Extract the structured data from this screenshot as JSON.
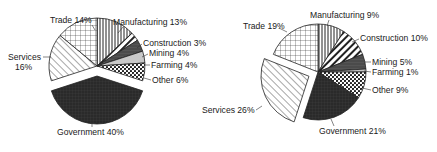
{
  "chart_data": [
    {
      "type": "pie",
      "title": "",
      "categories": [
        "Manufacturing",
        "Construction",
        "Mining",
        "Farming",
        "Other",
        "Government",
        "Services",
        "Trade"
      ],
      "values": [
        13,
        3,
        4,
        4,
        6,
        40,
        16,
        14
      ],
      "labels": [
        "Manufacturing 13%",
        "Construction 3%",
        "Mining 4%",
        "Farming 4%",
        "Other 6%",
        "Government 40%",
        "Services 16%",
        "Trade 14%"
      ],
      "exploded": "Government",
      "fills": [
        "vertical-lines",
        "diagonal-stripes",
        "dark-gray",
        "light-gray",
        "dots",
        "black-grid",
        "diagonal-lines",
        "grid"
      ]
    },
    {
      "type": "pie",
      "title": "",
      "categories": [
        "Manufacturing",
        "Construction",
        "Mining",
        "Farming",
        "Other",
        "Government",
        "Services",
        "Trade"
      ],
      "values": [
        9,
        10,
        5,
        1,
        9,
        21,
        26,
        19
      ],
      "labels": [
        "Manufacturing 9%",
        "Construction 10%",
        "Mining 5%",
        "Farming 1%",
        "Other 9%",
        "Government 21%",
        "Services 26%",
        "Trade 19%"
      ],
      "exploded": "Services",
      "fills": [
        "vertical-lines",
        "diagonal-stripes",
        "dark-gray",
        "light-gray",
        "dots",
        "black-grid",
        "diagonal-lines",
        "grid"
      ]
    }
  ],
  "labels": {
    "left": {
      "trade": "Trade 14%",
      "manufacturing": "Manufacturing 13%",
      "construction": "Construction 3%",
      "mining": "Mining 4%",
      "farming": "Farming 4%",
      "other": "Other 6%",
      "services_1": "Services",
      "services_2": "16%",
      "government": "Government 40%"
    },
    "right": {
      "trade": "Trade 19%",
      "manufacturing": "Manufacturing 9%",
      "construction": "Construction 10%",
      "mining": "Mining 5%",
      "farming": "Farming 1%",
      "other": "Other 9%",
      "services": "Services 26%",
      "government": "Government 21%"
    }
  }
}
